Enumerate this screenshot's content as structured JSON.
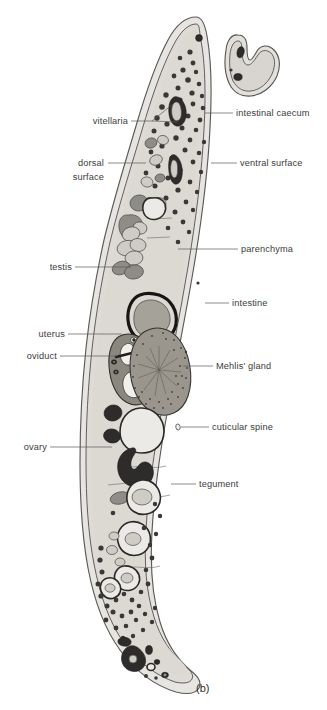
{
  "figure": {
    "caption": "(b)",
    "background_color": "#ffffff",
    "ink_color": "#3b3b3b"
  },
  "labels": [
    {
      "id": "vitellaria",
      "text": "vitellaria",
      "side": "left",
      "text_x": 128,
      "text_y": 124,
      "align": "end",
      "leaders": [
        [
          [
            131,
            121
          ],
          [
            152,
            121
          ],
          [
            173,
            104
          ]
        ],
        [
          [
            131,
            121
          ],
          [
            152,
            121
          ],
          [
            177,
            121
          ]
        ]
      ]
    },
    {
      "id": "intestinal-caecum",
      "text": "intestinal caecum",
      "side": "right",
      "text_x": 236,
      "text_y": 116,
      "align": "start",
      "leaders": [
        [
          [
            205,
            113
          ],
          [
            233,
            113
          ]
        ]
      ]
    },
    {
      "id": "dorsal-surface",
      "text": "dorsal",
      "text_line2": "surface",
      "side": "left",
      "text_x": 104,
      "text_y": 166,
      "text2_x": 104,
      "text2_y": 180,
      "align": "end",
      "leaders": [
        [
          [
            108,
            163
          ],
          [
            146,
            163
          ]
        ]
      ]
    },
    {
      "id": "ventral-surface",
      "text": "ventral surface",
      "side": "right",
      "text_x": 240,
      "text_y": 166,
      "align": "start",
      "leaders": [
        [
          [
            211,
            163
          ],
          [
            237,
            163
          ]
        ]
      ]
    },
    {
      "id": "parenchyma",
      "text": "parenchyma",
      "side": "right",
      "text_x": 241,
      "text_y": 252,
      "align": "start",
      "leaders": [
        [
          [
            178,
            249
          ],
          [
            238,
            249
          ]
        ]
      ]
    },
    {
      "id": "testis",
      "text": "testis",
      "side": "left",
      "text_x": 72,
      "text_y": 270,
      "align": "end",
      "leaders": [
        [
          [
            75,
            267
          ],
          [
            131,
            267
          ]
        ]
      ]
    },
    {
      "id": "intestine",
      "text": "intestine",
      "side": "right",
      "text_x": 232,
      "text_y": 306,
      "align": "start",
      "leaders": [
        [
          [
            205,
            303
          ],
          [
            229,
            303
          ]
        ]
      ]
    },
    {
      "id": "uterus",
      "text": "uterus",
      "side": "left",
      "text_x": 65,
      "text_y": 337,
      "align": "end",
      "leaders": [
        [
          [
            68,
            334
          ],
          [
            122,
            334
          ]
        ]
      ]
    },
    {
      "id": "oviduct",
      "text": "oviduct",
      "side": "left",
      "text_x": 57,
      "text_y": 359,
      "align": "end",
      "leaders": [
        [
          [
            60,
            356
          ],
          [
            118,
            356
          ]
        ]
      ]
    },
    {
      "id": "mehlis-gland",
      "text": "Mehlis' gland",
      "side": "right",
      "text_x": 216,
      "text_y": 369,
      "align": "start",
      "leaders": [
        [
          [
            190,
            366
          ],
          [
            213,
            366
          ]
        ]
      ]
    },
    {
      "id": "cuticular-spine",
      "text": "cuticular spine",
      "side": "right",
      "text_x": 212,
      "text_y": 430,
      "align": "start",
      "leaders": [
        [
          [
            180,
            427
          ],
          [
            209,
            427
          ]
        ]
      ]
    },
    {
      "id": "ovary",
      "text": "ovary",
      "side": "left",
      "text_x": 47,
      "text_y": 450,
      "align": "end",
      "leaders": [
        [
          [
            50,
            447
          ],
          [
            112,
            447
          ]
        ]
      ]
    },
    {
      "id": "tegument",
      "text": "tegument",
      "side": "right",
      "text_x": 199,
      "text_y": 487,
      "align": "start",
      "leaders": [
        [
          [
            171,
            484
          ],
          [
            196,
            484
          ]
        ]
      ]
    }
  ],
  "structures": {
    "body": "worm-body-outline",
    "caecum_detached": "intestinal-caecum-section",
    "intestine_sections": 2,
    "testis_count": 6,
    "caption_position": {
      "x": 196,
      "y": 692
    }
  }
}
